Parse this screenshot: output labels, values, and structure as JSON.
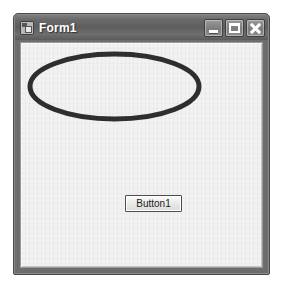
{
  "window": {
    "title": "Form1",
    "icon": "form-designer-icon",
    "controls": [
      {
        "name": "minimize",
        "label": "Minimize",
        "glyph": "_"
      },
      {
        "name": "maximize",
        "label": "Maximize",
        "glyph": "□"
      },
      {
        "name": "close",
        "label": "Close",
        "glyph": "✕"
      }
    ],
    "titlebar_color": "#6a6a6a",
    "client_color": "#f2f2f2"
  },
  "canvas": {
    "shapes": [
      {
        "type": "ellipse",
        "name": "drawn-ellipse",
        "stroke_color": "#2e2e2e",
        "stroke_width": 5,
        "fill": "none",
        "cx": 89.5,
        "cy": 37.5,
        "rx": 87,
        "ry": 35
      }
    ]
  },
  "controls": {
    "button1": {
      "label": "Button1",
      "name": "button1"
    }
  }
}
